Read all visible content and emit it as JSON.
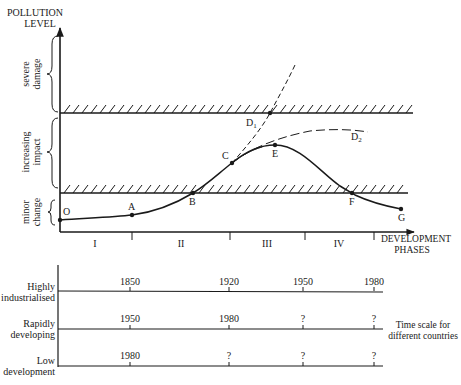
{
  "chart_data": {
    "type": "line",
    "title": "",
    "ylabel": "POLLUTION LEVEL",
    "xlabel": "DEVELOPMENT PHASES",
    "y_zones": [
      {
        "label_lines": [
          "severe",
          "damage"
        ],
        "range": "above upper threshold"
      },
      {
        "label_lines": [
          "increasing",
          "impact"
        ],
        "range": "between thresholds"
      },
      {
        "label_lines": [
          "minor",
          "change"
        ],
        "range": "below lower threshold"
      }
    ],
    "phases": [
      "I",
      "II",
      "III",
      "IV"
    ],
    "points": [
      {
        "label": "O",
        "x": 60,
        "y": 220
      },
      {
        "label": "A",
        "x": 132,
        "y": 215
      },
      {
        "label": "B",
        "x": 193,
        "y": 193
      },
      {
        "label": "C",
        "x": 232,
        "y": 163
      },
      {
        "label": "E",
        "x": 275,
        "y": 145
      },
      {
        "label": "F",
        "x": 352,
        "y": 193
      },
      {
        "label": "G",
        "x": 401,
        "y": 209
      }
    ],
    "branches": [
      {
        "label": "D1",
        "style": "dashed",
        "description": "unchecked growth crossing severe damage threshold"
      },
      {
        "label": "D2",
        "style": "dashed",
        "description": "levelling off below severe damage threshold"
      }
    ],
    "thresholds": [
      "upper (severe damage)",
      "lower (minor change)"
    ],
    "grid": false
  },
  "labels": {
    "y_axis_line1": "POLLUTION",
    "y_axis_line2": "LEVEL",
    "zone_severe_1": "severe",
    "zone_severe_2": "damage",
    "zone_increasing_1": "increasing",
    "zone_increasing_2": "impact",
    "zone_minor_1": "minor",
    "zone_minor_2": "change",
    "x_axis_line1": "DEVELOPMENT",
    "x_axis_line2": "PHASES",
    "phase_1": "I",
    "phase_2": "II",
    "phase_3": "III",
    "phase_4": "IV",
    "pt_O": "O",
    "pt_A": "A",
    "pt_B": "B",
    "pt_C": "C",
    "pt_D1": "D",
    "pt_D1_sub": "1",
    "pt_D2": "D",
    "pt_D2_sub": "2",
    "pt_E": "E",
    "pt_F": "F",
    "pt_G": "G"
  },
  "timescale": {
    "caption_line1": "Time scale for",
    "caption_line2": "different countries",
    "rows": [
      {
        "label_line1": "Highly",
        "label_line2": "industrialised",
        "years": [
          "1850",
          "1920",
          "1950",
          "1980"
        ]
      },
      {
        "label_line1": "Rapidly",
        "label_line2": "developing",
        "years": [
          "1950",
          "1980",
          "?",
          "?"
        ]
      },
      {
        "label_line1": "Low",
        "label_line2": "development",
        "years": [
          "1980",
          "?",
          "?",
          "?"
        ]
      }
    ]
  }
}
